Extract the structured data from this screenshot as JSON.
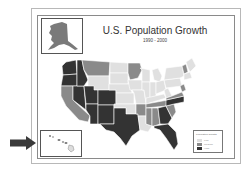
{
  "map": {
    "title": "U.S. Population Growth",
    "subtitle": "1990 - 2000",
    "insets": [
      "Alaska",
      "Hawaii"
    ],
    "legend": {
      "title": "Population Growth",
      "items": [
        {
          "label": "Low",
          "color": "#e0e0e0"
        },
        {
          "label": "Medium",
          "color": "#8a8a8a"
        },
        {
          "label": "High",
          "color": "#333333"
        }
      ]
    },
    "colors": {
      "low": "#e0e0e0",
      "medium": "#8a8a8a",
      "high": "#333333",
      "border": "#ffffff",
      "arrow": "#3a3a3a"
    }
  }
}
